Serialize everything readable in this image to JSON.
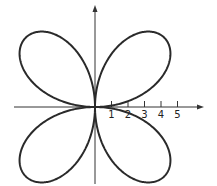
{
  "chart_data": {
    "type": "line",
    "title": "",
    "equation": "r = a sin 2θ",
    "xlabel": "",
    "ylabel": "",
    "x_tick_labels": [
      "1",
      "2",
      "3",
      "4",
      "5"
    ],
    "x_ticks": [
      1,
      2,
      3,
      4,
      5
    ],
    "petals": 4,
    "grid": false,
    "legend": null
  },
  "colors": {
    "curve": "#2a2a2a",
    "axis": "#333333"
  }
}
